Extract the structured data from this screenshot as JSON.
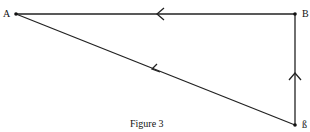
{
  "figure": {
    "caption": "Figure 3",
    "points": {
      "A": {
        "label": "A",
        "x": 16,
        "y": 14
      },
      "B": {
        "label": "B",
        "x": 295,
        "y": 14
      },
      "C": {
        "label": "ß",
        "x": 295,
        "y": 125
      }
    },
    "edges": [
      {
        "from": "B",
        "to": "A",
        "arrow": "left"
      },
      {
        "from": "C",
        "to": "B",
        "arrow": "up"
      },
      {
        "from": "C",
        "to": "A",
        "arrow": "toward-A"
      }
    ],
    "line_color": "#222222"
  }
}
